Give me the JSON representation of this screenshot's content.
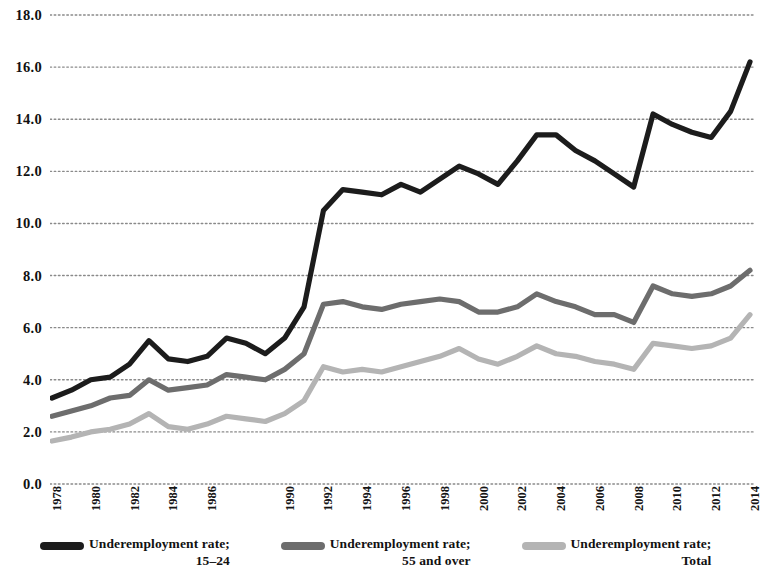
{
  "chart_data": {
    "type": "line",
    "title": "",
    "xlabel": "",
    "ylabel": "",
    "ylim": [
      0.0,
      18.0
    ],
    "ytick_step": 2.0,
    "ytick_labels": [
      "18.0",
      "16.0",
      "14.0",
      "12.0",
      "10.0",
      "8.0",
      "6.0",
      "4.0",
      "2.0",
      "0.0"
    ],
    "grid": "horizontal-dotted",
    "legend_position": "bottom",
    "x": [
      1978,
      1979,
      1980,
      1981,
      1982,
      1983,
      1984,
      1985,
      1986,
      1987,
      1988,
      1989,
      1990,
      1991,
      1992,
      1993,
      1994,
      1995,
      1996,
      1997,
      1998,
      1999,
      2000,
      2001,
      2002,
      2003,
      2004,
      2005,
      2006,
      2007,
      2008,
      2009,
      2010,
      2011,
      2012,
      2013,
      2014
    ],
    "xtick_labels": [
      "1978",
      "1980",
      "1982",
      "1984",
      "1986",
      "1990",
      "1992",
      "1994",
      "1996",
      "1998",
      "2000",
      "2002",
      "2004",
      "2006",
      "2008",
      "2010",
      "2012",
      "2014"
    ],
    "series": [
      {
        "name": "Underemployment rate; 15-24",
        "color": "#1c1c1c",
        "values": [
          3.3,
          3.6,
          4.0,
          4.1,
          4.6,
          5.5,
          4.8,
          4.7,
          4.9,
          5.6,
          5.4,
          5.0,
          5.6,
          6.8,
          10.5,
          11.3,
          11.2,
          11.1,
          11.5,
          11.2,
          11.7,
          12.2,
          11.9,
          11.5,
          12.4,
          13.4,
          13.4,
          12.8,
          12.4,
          11.9,
          11.4,
          14.2,
          13.8,
          13.5,
          13.3,
          14.3,
          16.2
        ]
      },
      {
        "name": "Underemployment rate; 55 and over",
        "color": "#6d6d6d",
        "values": [
          2.6,
          2.8,
          3.0,
          3.3,
          3.4,
          4.0,
          3.6,
          3.7,
          3.8,
          4.2,
          4.1,
          4.0,
          4.4,
          5.0,
          6.9,
          7.0,
          6.8,
          6.7,
          6.9,
          7.0,
          7.1,
          7.0,
          6.6,
          6.6,
          6.8,
          7.3,
          7.0,
          6.8,
          6.5,
          6.5,
          6.2,
          7.6,
          7.3,
          7.2,
          7.3,
          7.6,
          8.2
        ]
      },
      {
        "name": "Underemployment rate; Total",
        "color": "#b4b4b4",
        "values": [
          1.65,
          1.8,
          2.0,
          2.1,
          2.3,
          2.7,
          2.2,
          2.1,
          2.3,
          2.6,
          2.5,
          2.4,
          2.7,
          3.2,
          4.5,
          4.3,
          4.4,
          4.3,
          4.5,
          4.7,
          4.9,
          5.2,
          4.8,
          4.6,
          4.9,
          5.3,
          5.0,
          4.9,
          4.7,
          4.6,
          4.4,
          5.4,
          5.3,
          5.2,
          5.3,
          5.6,
          6.5
        ]
      }
    ]
  },
  "legend": {
    "items": [
      {
        "line1": "Underemployment rate;",
        "line2": "15–24",
        "color": "#1c1c1c",
        "swatch": "legend-swatch-15-24"
      },
      {
        "line1": "Underemployment rate;",
        "line2": "55 and over",
        "color": "#6d6d6d",
        "swatch": "legend-swatch-55-over"
      },
      {
        "line1": "Underemployment rate;",
        "line2": "Total",
        "color": "#b4b4b4",
        "swatch": "legend-swatch-total"
      }
    ]
  }
}
